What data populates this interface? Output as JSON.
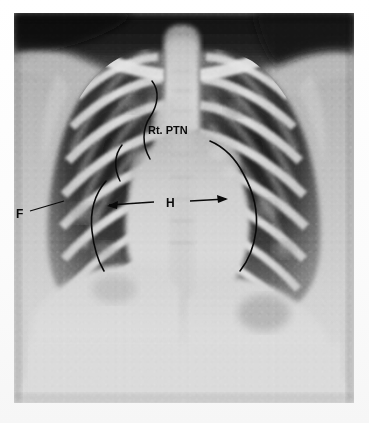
{
  "figure": {
    "modality_label": "chest-radiograph",
    "view": "frontal",
    "frame": {
      "left": 14,
      "top": 13,
      "width": 340,
      "height": 390
    },
    "background_color": "#ffffff",
    "film_base_color": "#c8c8c8"
  },
  "annotations": [
    {
      "id": "rt-ptn",
      "label": "Rt. PTN",
      "x": 148,
      "y": 131,
      "leader": "curved",
      "meaning_region": "right-paratracheal-node"
    },
    {
      "id": "heart-width",
      "label": "H",
      "x": 168,
      "y": 207,
      "leader": "double-headed-arrow",
      "arrow_left_x": 107,
      "arrow_left_y": 206,
      "arrow_right_x": 228,
      "arrow_right_y": 200,
      "meaning_region": "heart-transverse-diameter"
    },
    {
      "id": "fissure",
      "label": "F",
      "x": 17,
      "y": 216,
      "leader": "straight-line",
      "leader_end_x": 62,
      "leader_end_y": 203,
      "meaning_region": "fissure"
    }
  ],
  "braces": [
    {
      "id": "brace-upper-right-mediastinum",
      "side": "image-left",
      "style": "curved-line"
    },
    {
      "id": "brace-right-heart-border",
      "side": "image-left",
      "style": "curved-line"
    },
    {
      "id": "brace-left-heart-border",
      "side": "image-right",
      "style": "curved-line"
    }
  ],
  "ink_color": "#0a0a0a"
}
